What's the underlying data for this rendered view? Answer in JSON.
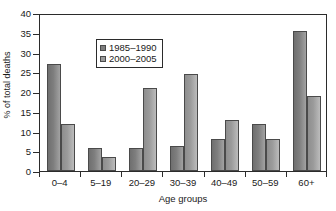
{
  "chart_data": {
    "type": "bar",
    "title": "",
    "xlabel": "Age groups",
    "ylabel": "% of total deaths",
    "categories": [
      "0–4",
      "5–19",
      "20–29",
      "30–39",
      "40–49",
      "50–59",
      "60+"
    ],
    "series": [
      {
        "name": "1985–1990",
        "color": "#7e7e7e",
        "values": [
          27,
          5.8,
          5.8,
          6.3,
          8.2,
          12,
          35.5
        ]
      },
      {
        "name": "2000–2005",
        "color": "#9b9b9b",
        "values": [
          11.8,
          3.6,
          21,
          24.5,
          13,
          8,
          19
        ]
      }
    ],
    "ylim": [
      0,
      40
    ],
    "yticks": [
      0,
      5,
      10,
      15,
      20,
      25,
      30,
      35,
      40
    ],
    "ytick_labels": [
      "0",
      "5",
      "10",
      "15",
      "20",
      "25",
      "30",
      "35",
      "40"
    ],
    "grid": false,
    "legend_position": "upper-left-inside"
  }
}
